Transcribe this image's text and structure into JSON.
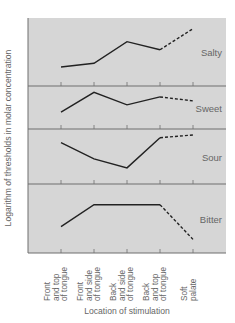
{
  "chart_data": {
    "type": "line",
    "title": "",
    "xlabel": "Location of stimulation",
    "ylabel": "Logarithm of thresholds in molar concentration",
    "categories": [
      "Front and top of tongue",
      "Front and side of tongue",
      "Back and side of tongue",
      "Back and top of tongue",
      "Soft palate"
    ],
    "category_lines": [
      [
        "Front",
        "and top",
        "of tongue"
      ],
      [
        "Front",
        "and side",
        "of tongue"
      ],
      [
        "Back",
        "and side",
        "of tongue"
      ],
      [
        "Back",
        "and top",
        "of tongue"
      ],
      [
        "Soft",
        "palate"
      ]
    ],
    "grid": false,
    "legend": "none",
    "value_scale": "relative threshold (0 = panel bottom, 1 = panel top)",
    "panels": [
      {
        "name": "Salty",
        "values": [
          0.24,
          0.31,
          0.71,
          0.56,
          0.95
        ],
        "dashed_from_index": 3
      },
      {
        "name": "Sweet",
        "values": [
          0.33,
          0.93,
          0.55,
          0.79,
          0.67
        ],
        "dashed_from_index": 3
      },
      {
        "name": "Sour",
        "values": [
          0.83,
          0.47,
          0.27,
          0.94,
          1.0
        ],
        "dashed_from_index": 3
      },
      {
        "name": "Bitter",
        "values": [
          0.36,
          0.79,
          0.79,
          0.79,
          0.11
        ],
        "dashed_from_index": 3
      }
    ]
  },
  "colors": {
    "panel_fill": "#d6d6d6",
    "divider": "#6e6e6e",
    "line": "#222222",
    "text": "#666666"
  }
}
